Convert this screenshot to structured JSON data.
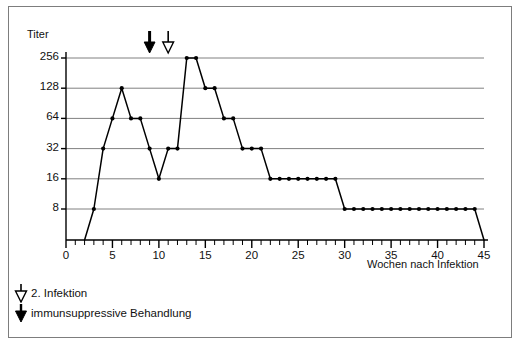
{
  "chart_data": {
    "type": "line",
    "title": "",
    "xlabel": "Wochen nach Infektion",
    "ylabel": "Titer",
    "xlim": [
      0,
      45
    ],
    "ylim": [
      4,
      256
    ],
    "yscale": "log2",
    "grid": true,
    "legend_position": "below-axes-left",
    "x_ticks_major": [
      0,
      5,
      10,
      15,
      20,
      25,
      30,
      35,
      40,
      45
    ],
    "x_ticks_minor_step": 1,
    "y_ticks": [
      8,
      16,
      32,
      64,
      128,
      256
    ],
    "y_tick_labels": [
      "8",
      "16",
      "32",
      "64",
      "128",
      "256"
    ],
    "series": [
      {
        "name": "Titer",
        "marker": "dot",
        "color": "#000000",
        "points": [
          {
            "x": 2,
            "y": 4
          },
          {
            "x": 3,
            "y": 8
          },
          {
            "x": 4,
            "y": 32
          },
          {
            "x": 5,
            "y": 64
          },
          {
            "x": 6,
            "y": 128
          },
          {
            "x": 7,
            "y": 64
          },
          {
            "x": 8,
            "y": 64
          },
          {
            "x": 9,
            "y": 32
          },
          {
            "x": 10,
            "y": 16
          },
          {
            "x": 11,
            "y": 32
          },
          {
            "x": 12,
            "y": 32
          },
          {
            "x": 13,
            "y": 256
          },
          {
            "x": 14,
            "y": 256
          },
          {
            "x": 15,
            "y": 128
          },
          {
            "x": 16,
            "y": 128
          },
          {
            "x": 17,
            "y": 64
          },
          {
            "x": 18,
            "y": 64
          },
          {
            "x": 19,
            "y": 32
          },
          {
            "x": 20,
            "y": 32
          },
          {
            "x": 21,
            "y": 32
          },
          {
            "x": 22,
            "y": 16
          },
          {
            "x": 23,
            "y": 16
          },
          {
            "x": 24,
            "y": 16
          },
          {
            "x": 25,
            "y": 16
          },
          {
            "x": 26,
            "y": 16
          },
          {
            "x": 27,
            "y": 16
          },
          {
            "x": 28,
            "y": 16
          },
          {
            "x": 29,
            "y": 16
          },
          {
            "x": 30,
            "y": 8
          },
          {
            "x": 31,
            "y": 8
          },
          {
            "x": 32,
            "y": 8
          },
          {
            "x": 33,
            "y": 8
          },
          {
            "x": 34,
            "y": 8
          },
          {
            "x": 35,
            "y": 8
          },
          {
            "x": 36,
            "y": 8
          },
          {
            "x": 37,
            "y": 8
          },
          {
            "x": 38,
            "y": 8
          },
          {
            "x": 39,
            "y": 8
          },
          {
            "x": 40,
            "y": 8
          },
          {
            "x": 41,
            "y": 8
          },
          {
            "x": 42,
            "y": 8
          },
          {
            "x": 43,
            "y": 8
          },
          {
            "x": 44,
            "y": 8
          },
          {
            "x": 45,
            "y": 4
          }
        ]
      }
    ],
    "annotations": [
      {
        "id": "immunosuppression-marker",
        "x": 9,
        "marker": "filled-down-arrow",
        "label": "immunsuppressive Behandlung"
      },
      {
        "id": "second-infection-marker",
        "x": 11,
        "marker": "hollow-down-arrow",
        "label": "2. Infektion"
      }
    ]
  },
  "axes": {
    "y_title": "Titer",
    "x_title": "Wochen nach Infektion"
  },
  "legend": {
    "items": [
      {
        "marker": "hollow-down-arrow",
        "label": "2. Infektion"
      },
      {
        "marker": "filled-down-arrow",
        "label": "immunsuppressive Behandlung"
      }
    ]
  },
  "colors": {
    "line": "#000000",
    "grid": "#808080",
    "axis": "#000000",
    "frame": "#7d7d7d",
    "background": "#ffffff"
  }
}
